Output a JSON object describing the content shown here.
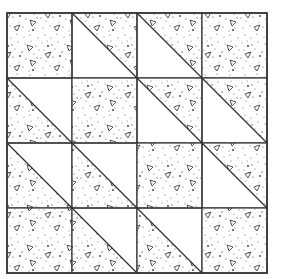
{
  "quilt": {
    "title": "Quilt block pattern",
    "grid_size": 4,
    "origin": [
      7,
      13
    ],
    "cell_size": 65,
    "colors": {
      "background": "#ffffff",
      "line": "#333333",
      "speckle": "#444444"
    },
    "legend": {
      "s": "fully speckled",
      "UR": "upper-right half speckled (TL-BR diagonal)",
      "LL": "lower-left half speckled (TL-BR diagonal)"
    },
    "cells": [
      [
        "s",
        "UR",
        "UR",
        "s"
      ],
      [
        "LL",
        "s",
        "UR",
        "UR"
      ],
      [
        "LL",
        "LL",
        "s",
        "UR"
      ],
      [
        "s",
        "LL",
        "LL",
        "s"
      ]
    ]
  }
}
